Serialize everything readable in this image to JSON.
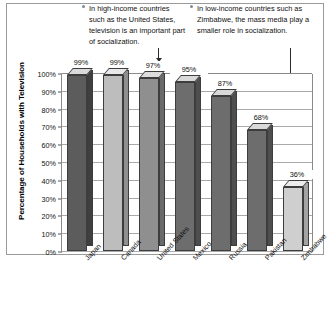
{
  "callouts": {
    "left": {
      "text": "In high-income countries such as the United States, television is an important part of socialization.",
      "bullet_icon": "bullet-dot-icon",
      "points_to": "United States"
    },
    "right": {
      "text": "In low-income countries such as Zimbabwe, the mass media play a smaller role in socialization.",
      "bullet_icon": "bullet-dot-icon",
      "points_to": "Zimbabwe"
    }
  },
  "chart_data": {
    "type": "bar",
    "title": "",
    "xlabel": "",
    "ylabel": "Percentage of Households with Television",
    "ylim": [
      0,
      100
    ],
    "grid": true,
    "legend": "none",
    "categories": [
      "Japan",
      "Canada",
      "United States",
      "Mexico",
      "Russia",
      "Pakistan",
      "Zimbabwe"
    ],
    "values": [
      99,
      99,
      97,
      95,
      87,
      68,
      36
    ],
    "value_labels": [
      "99%",
      "99%",
      "97%",
      "95%",
      "87%",
      "68%",
      "36%"
    ],
    "ytick_labels": [
      "100%",
      "90%",
      "80%",
      "70%",
      "60%",
      "50%",
      "40%",
      "30%",
      "20%",
      "10%",
      "0%"
    ],
    "ytick_values": [
      100,
      90,
      80,
      70,
      60,
      50,
      40,
      30,
      20,
      10,
      0
    ],
    "bar_colors": [
      "#5c5c5c",
      "#bdbdbd",
      "#8f8f8f",
      "#6d6d6d",
      "#6d6d6d",
      "#6d6d6d",
      "#cfcfcf"
    ],
    "bar_top_colors": [
      "#d9d9d9",
      "#e8e8e8",
      "#dcdcdc",
      "#d9d9d9",
      "#d9d9d9",
      "#d9d9d9",
      "#ededed"
    ],
    "bar_side_colors": [
      "#3f3f3f",
      "#8f8f8f",
      "#6a6a6a",
      "#4e4e4e",
      "#4e4e4e",
      "#4e4e4e",
      "#a3a3a3"
    ]
  }
}
